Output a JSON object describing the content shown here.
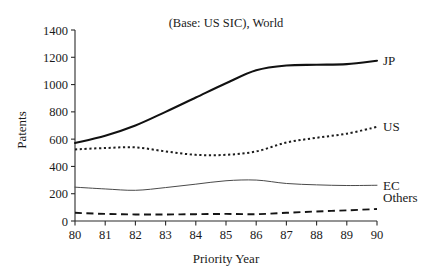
{
  "chart_data": {
    "type": "line",
    "title": "(Base: US SIC), World",
    "xlabel": "Priority Year",
    "ylabel": "Patents",
    "x": [
      80,
      81,
      82,
      83,
      84,
      85,
      86,
      87,
      88,
      89,
      90
    ],
    "xtick_labels": [
      "80",
      "81",
      "82",
      "83",
      "84",
      "85",
      "86",
      "87",
      "88",
      "89",
      "90"
    ],
    "ytick_labels": [
      "0",
      "200",
      "400",
      "600",
      "800",
      "1000",
      "1200",
      "1400"
    ],
    "yticks": [
      0,
      200,
      400,
      600,
      800,
      1000,
      1200,
      1400
    ],
    "ylim": [
      0,
      1400
    ],
    "xlim": [
      80,
      90
    ],
    "grid": false,
    "legend_position": "right-end-of-line",
    "series": [
      {
        "name": "JP",
        "style": "solid-thick",
        "values": [
          572,
          625,
          700,
          800,
          905,
          1010,
          1105,
          1140,
          1145,
          1150,
          1175
        ]
      },
      {
        "name": "US",
        "style": "dotted",
        "values": [
          525,
          535,
          540,
          510,
          485,
          485,
          510,
          575,
          610,
          640,
          690
        ]
      },
      {
        "name": "EC",
        "style": "solid-thin",
        "values": [
          248,
          235,
          225,
          245,
          270,
          295,
          300,
          275,
          265,
          260,
          262
        ]
      },
      {
        "name": "Others",
        "style": "dashed",
        "values": [
          60,
          52,
          48,
          48,
          50,
          52,
          50,
          60,
          70,
          78,
          88
        ]
      }
    ]
  },
  "labels": {
    "jp": "JP",
    "us": "US",
    "ec": "EC",
    "others": "Others"
  }
}
